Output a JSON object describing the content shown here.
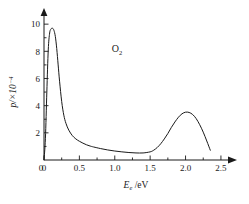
{
  "chart_data": {
    "type": "line",
    "title": "",
    "subtitle": "",
    "xlabel": "E_e /eV",
    "xlabel_main": "E",
    "xlabel_sub": "e",
    "xlabel_tail": " /eV",
    "ylabel": "p/×10⁻⁴",
    "ylabel_main": "p/×10",
    "ylabel_sup": "−4",
    "annotation": "O₂",
    "annotation_main": "O",
    "annotation_sub": "2",
    "xlim": [
      0,
      2.6
    ],
    "ylim": [
      0,
      10.6
    ],
    "grid": false,
    "legend": "none",
    "x_ticks": [
      0,
      0.5,
      1.0,
      1.5,
      2.0,
      2.5
    ],
    "x_tick_labels": [
      "0",
      "0.5",
      "1.0",
      "1.5",
      "2.0",
      "2.5"
    ],
    "x_minor_ticks": [
      0.25,
      0.75,
      1.25,
      1.75,
      2.25
    ],
    "y_ticks": [
      2,
      4,
      6,
      8,
      10
    ],
    "y_tick_labels": [
      "2",
      "4",
      "6",
      "8",
      "10"
    ],
    "y_minor_ticks": [
      1,
      3,
      5,
      7,
      9
    ],
    "axis_arrows": true,
    "series": [
      {
        "name": "O2 electron energy distribution",
        "x": [
          0.0,
          0.02,
          0.04,
          0.06,
          0.08,
          0.1,
          0.12,
          0.14,
          0.16,
          0.18,
          0.2,
          0.22,
          0.25,
          0.28,
          0.31,
          0.35,
          0.4,
          0.45,
          0.5,
          0.55,
          0.6,
          0.65,
          0.7,
          0.8,
          0.9,
          1.0,
          1.1,
          1.2,
          1.3,
          1.4,
          1.5,
          1.55,
          1.6,
          1.65,
          1.7,
          1.75,
          1.8,
          1.85,
          1.9,
          1.95,
          2.0,
          2.05,
          2.1,
          2.15,
          2.2,
          2.25,
          2.3,
          2.35
        ],
        "y": [
          0.0,
          1.6,
          5.0,
          8.1,
          9.35,
          9.65,
          9.7,
          9.55,
          9.1,
          8.2,
          7.0,
          5.8,
          4.3,
          3.3,
          2.7,
          2.2,
          1.8,
          1.55,
          1.38,
          1.24,
          1.12,
          1.03,
          0.96,
          0.84,
          0.74,
          0.66,
          0.6,
          0.55,
          0.52,
          0.52,
          0.6,
          0.72,
          0.92,
          1.2,
          1.55,
          1.95,
          2.4,
          2.8,
          3.15,
          3.4,
          3.52,
          3.5,
          3.35,
          3.05,
          2.6,
          2.05,
          1.4,
          0.72
        ]
      }
    ]
  }
}
